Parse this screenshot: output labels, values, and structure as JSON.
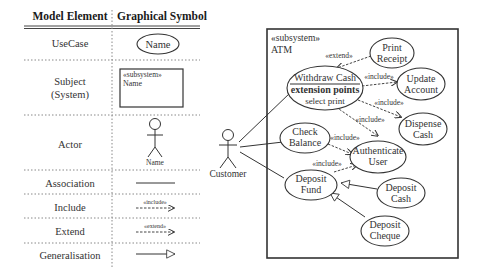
{
  "legend_table": {
    "headers": {
      "element": "Model Element",
      "symbol": "Graphical Symbol"
    },
    "rows": [
      {
        "element": "UseCase",
        "symbol_type": "ellipse",
        "symbol_text": "Name"
      },
      {
        "element_line1": "Subject",
        "element_line2": "(System)",
        "symbol_type": "box",
        "symbol_stereotype": "«subsystem»",
        "symbol_text": "Name"
      },
      {
        "element": "Actor",
        "symbol_type": "stick-figure",
        "symbol_text": "Name"
      },
      {
        "element": "Association",
        "symbol_type": "solid-line"
      },
      {
        "element": "Include",
        "symbol_type": "dashed-arrow",
        "symbol_text": "«include»"
      },
      {
        "element": "Extend",
        "symbol_type": "dashed-arrow",
        "symbol_text": "«extend»"
      },
      {
        "element": "Generalisation",
        "symbol_type": "hollow-triangle-arrow"
      }
    ]
  },
  "diagram": {
    "actor": {
      "name": "Customer"
    },
    "subsystem": {
      "stereotype": "«subsystem»",
      "name": "ATM"
    },
    "use_cases": {
      "print_receipt": {
        "line1": "Print",
        "line2": "Receipt"
      },
      "withdraw_cash": {
        "title": "Withdraw Cash",
        "compartment": "extension points",
        "point": "select print"
      },
      "update_account": {
        "line1": "Update",
        "line2": "Account"
      },
      "dispense_cash": {
        "line1": "Dispense",
        "line2": "Cash"
      },
      "check_balance": {
        "line1": "Check",
        "line2": "Balance"
      },
      "authenticate_user": {
        "line1": "Authenticate",
        "line2": "User"
      },
      "deposit_fund": {
        "line1": "Deposit",
        "line2": "Fund"
      },
      "deposit_cash": {
        "line1": "Deposit",
        "line2": "Cash"
      },
      "deposit_cheque": {
        "line1": "Deposit",
        "line2": "Cheque"
      }
    },
    "relationship_labels": {
      "extend_print": "«extend»",
      "include_update": "«include»",
      "include_dispense": "«include»",
      "include_auth_from_withdraw": "«include»",
      "include_auth_from_balance": "«include»",
      "include_auth_from_deposit": "«include»"
    }
  }
}
